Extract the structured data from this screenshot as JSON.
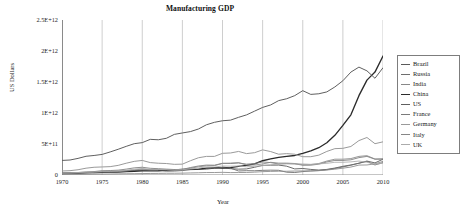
{
  "chart_data": {
    "type": "line",
    "title": "Manufacturing GDP",
    "xlabel": "Year",
    "ylabel": "US Dollars",
    "grid": "vertical-only",
    "legend_position": "right-outside",
    "xlim": [
      1970,
      2010
    ],
    "ylim": [
      0,
      2500000000000.0
    ],
    "xticks": [
      1970,
      1975,
      1980,
      1985,
      1990,
      1995,
      2000,
      2005,
      2010
    ],
    "xticklabels": [
      "1970",
      "1975",
      "1980",
      "1985",
      "1990",
      "1995",
      "2000",
      "2005",
      "2010"
    ],
    "yticks": [
      0,
      500000000000,
      1000000000000,
      1500000000000,
      2000000000000,
      2500000000000
    ],
    "yticklabels": [
      "0",
      "5E+11",
      "1E+12",
      "1.5E+12",
      "2E+12",
      "2.5E+12"
    ],
    "x": [
      1970,
      1971,
      1972,
      1973,
      1974,
      1975,
      1976,
      1977,
      1978,
      1979,
      1980,
      1981,
      1982,
      1983,
      1984,
      1985,
      1986,
      1987,
      1988,
      1989,
      1990,
      1991,
      1992,
      1993,
      1994,
      1995,
      1996,
      1997,
      1998,
      1999,
      2000,
      2001,
      2002,
      2003,
      2004,
      2005,
      2006,
      2007,
      2008,
      2009,
      2010
    ],
    "series": [
      {
        "name": "Brazil",
        "color": "#5a5a5a",
        "width": 0.9,
        "values": [
          20000000000.0,
          23000000000.0,
          27000000000.0,
          34000000000.0,
          42000000000.0,
          48000000000.0,
          56000000000.0,
          62000000000.0,
          69000000000.0,
          74000000000.0,
          80000000000.0,
          84000000000.0,
          82000000000.0,
          62000000000.0,
          64000000000.0,
          72000000000.0,
          86000000000.0,
          90000000000.0,
          94000000000.0,
          110000000000.0,
          115000000000.0,
          102000000000.0,
          94000000000.0,
          98000000000.0,
          125000000000.0,
          155000000000.0,
          158000000000.0,
          160000000000.0,
          142000000000.0,
          98000000000.0,
          105000000000.0,
          90000000000.0,
          80000000000.0,
          90000000000.0,
          112000000000.0,
          140000000000.0,
          162000000000.0,
          190000000000.0,
          225000000000.0,
          195000000000.0,
          255000000000.0
        ]
      },
      {
        "name": "Russia",
        "color": "#6e6e6e",
        "width": 0.9,
        "values": [
          0,
          0,
          0,
          0,
          0,
          0,
          0,
          0,
          0,
          0,
          0,
          0,
          0,
          0,
          0,
          0,
          0,
          0,
          0,
          0,
          130000000000.0,
          110000000000.0,
          65000000000.0,
          70000000000.0,
          68000000000.0,
          75000000000.0,
          78000000000.0,
          76000000000.0,
          45000000000.0,
          40000000000.0,
          55000000000.0,
          65000000000.0,
          72000000000.0,
          85000000000.0,
          105000000000.0,
          130000000000.0,
          158000000000.0,
          190000000000.0,
          220000000000.0,
          162000000000.0,
          200000000000.0
        ]
      },
      {
        "name": "India",
        "color": "#888888",
        "width": 0.85,
        "values": [
          9000000000.0,
          9500000000.0,
          10000000000.0,
          12000000000.0,
          14000000000.0,
          15000000000.0,
          16000000000.0,
          18000000000.0,
          20000000000.0,
          21000000000.0,
          23000000000.0,
          25000000000.0,
          26000000000.0,
          28000000000.0,
          28000000000.0,
          30000000000.0,
          33000000000.0,
          36000000000.0,
          40000000000.0,
          40000000000.0,
          43000000000.0,
          39000000000.0,
          40000000000.0,
          41000000000.0,
          46000000000.0,
          54000000000.0,
          58000000000.0,
          61000000000.0,
          60000000000.0,
          64000000000.0,
          66000000000.0,
          66000000000.0,
          70000000000.0,
          80000000000.0,
          94000000000.0,
          110000000000.0,
          128000000000.0,
          160000000000.0,
          162000000000.0,
          180000000000.0,
          220000000000.0
        ]
      },
      {
        "name": "China",
        "color": "#2b2b2b",
        "width": 1.35,
        "values": [
          30000000000.0,
          33000000000.0,
          35000000000.0,
          39000000000.0,
          41000000000.0,
          45000000000.0,
          44000000000.0,
          48000000000.0,
          55000000000.0,
          60000000000.0,
          66000000000.0,
          67000000000.0,
          69000000000.0,
          74000000000.0,
          82000000000.0,
          92000000000.0,
          90000000000.0,
          95000000000.0,
          110000000000.0,
          118000000000.0,
          112000000000.0,
          120000000000.0,
          140000000000.0,
          155000000000.0,
          180000000000.0,
          230000000000.0,
          260000000000.0,
          285000000000.0,
          300000000000.0,
          315000000000.0,
          350000000000.0,
          390000000000.0,
          440000000000.0,
          520000000000.0,
          640000000000.0,
          800000000000.0,
          970000000000.0,
          1280000000000.0,
          1530000000000.0,
          1660000000000.0,
          1920000000000.0
        ]
      },
      {
        "name": "US",
        "color": "#5f5f5f",
        "width": 1.0,
        "values": [
          235000000000.0,
          242000000000.0,
          268000000000.0,
          302000000000.0,
          315000000000.0,
          332000000000.0,
          372000000000.0,
          415000000000.0,
          462000000000.0,
          505000000000.0,
          522000000000.0,
          575000000000.0,
          568000000000.0,
          592000000000.0,
          655000000000.0,
          678000000000.0,
          700000000000.0,
          742000000000.0,
          810000000000.0,
          850000000000.0,
          875000000000.0,
          885000000000.0,
          930000000000.0,
          970000000000.0,
          1030000000000.0,
          1090000000000.0,
          1130000000000.0,
          1200000000000.0,
          1230000000000.0,
          1280000000000.0,
          1360000000000.0,
          1300000000000.0,
          1310000000000.0,
          1340000000000.0,
          1420000000000.0,
          1520000000000.0,
          1660000000000.0,
          1740000000000.0,
          1680000000000.0,
          1560000000000.0,
          1730000000000.0
        ]
      },
      {
        "name": "France",
        "color": "#7a7a7a",
        "width": 0.85,
        "values": [
          30000000000.0,
          33000000000.0,
          40000000000.0,
          50000000000.0,
          55000000000.0,
          70000000000.0,
          72000000000.0,
          78000000000.0,
          95000000000.0,
          115000000000.0,
          125000000000.0,
          108000000000.0,
          102000000000.0,
          95000000000.0,
          88000000000.0,
          90000000000.0,
          120000000000.0,
          145000000000.0,
          160000000000.0,
          158000000000.0,
          190000000000.0,
          185000000000.0,
          195000000000.0,
          175000000000.0,
          185000000000.0,
          210000000000.0,
          200000000000.0,
          178000000000.0,
          185000000000.0,
          180000000000.0,
          158000000000.0,
          158000000000.0,
          175000000000.0,
          210000000000.0,
          235000000000.0,
          235000000000.0,
          245000000000.0,
          280000000000.0,
          300000000000.0,
          255000000000.0,
          255000000000.0
        ]
      },
      {
        "name": "Germany",
        "color": "#9a9a9a",
        "width": 1.0,
        "values": [
          65000000000.0,
          70000000000.0,
          85000000000.0,
          110000000000.0,
          125000000000.0,
          130000000000.0,
          135000000000.0,
          155000000000.0,
          190000000000.0,
          220000000000.0,
          235000000000.0,
          200000000000.0,
          190000000000.0,
          185000000000.0,
          172000000000.0,
          175000000000.0,
          230000000000.0,
          278000000000.0,
          300000000000.0,
          300000000000.0,
          350000000000.0,
          355000000000.0,
          380000000000.0,
          345000000000.0,
          360000000000.0,
          405000000000.0,
          378000000000.0,
          335000000000.0,
          345000000000.0,
          335000000000.0,
          295000000000.0,
          295000000000.0,
          320000000000.0,
          380000000000.0,
          425000000000.0,
          430000000000.0,
          460000000000.0,
          555000000000.0,
          605000000000.0,
          505000000000.0,
          535000000000.0
        ]
      },
      {
        "name": "Italy",
        "color": "#868686",
        "width": 0.85,
        "values": [
          28000000000.0,
          30000000000.0,
          34000000000.0,
          38000000000.0,
          44000000000.0,
          48000000000.0,
          46000000000.0,
          54000000000.0,
          64000000000.0,
          82000000000.0,
          95000000000.0,
          84000000000.0,
          84000000000.0,
          86000000000.0,
          82000000000.0,
          84000000000.0,
          110000000000.0,
          132000000000.0,
          148000000000.0,
          152000000000.0,
          185000000000.0,
          192000000000.0,
          198000000000.0,
          162000000000.0,
          162000000000.0,
          178000000000.0,
          205000000000.0,
          192000000000.0,
          192000000000.0,
          185000000000.0,
          165000000000.0,
          168000000000.0,
          185000000000.0,
          225000000000.0,
          255000000000.0,
          255000000000.0,
          265000000000.0,
          300000000000.0,
          312000000000.0,
          258000000000.0,
          262000000000.0
        ]
      },
      {
        "name": "UK",
        "color": "#ababab",
        "width": 0.85,
        "values": [
          32000000000.0,
          35000000000.0,
          40000000000.0,
          46000000000.0,
          48000000000.0,
          58000000000.0,
          56000000000.0,
          64000000000.0,
          78000000000.0,
          95000000000.0,
          105000000000.0,
          92000000000.0,
          88000000000.0,
          84000000000.0,
          80000000000.0,
          86000000000.0,
          95000000000.0,
          112000000000.0,
          130000000000.0,
          128000000000.0,
          145000000000.0,
          142000000000.0,
          145000000000.0,
          132000000000.0,
          140000000000.0,
          152000000000.0,
          162000000000.0,
          178000000000.0,
          180000000000.0,
          178000000000.0,
          178000000000.0,
          172000000000.0,
          180000000000.0,
          188000000000.0,
          205000000000.0,
          205000000000.0,
          212000000000.0,
          225000000000.0,
          205000000000.0,
          172000000000.0,
          192000000000.0
        ]
      }
    ]
  },
  "legend": {
    "items": [
      {
        "label": "Brazil"
      },
      {
        "label": "Russia"
      },
      {
        "label": "India"
      },
      {
        "label": "China"
      },
      {
        "label": "US"
      },
      {
        "label": "France"
      },
      {
        "label": "Germany"
      },
      {
        "label": "Italy"
      },
      {
        "label": "UK"
      }
    ]
  }
}
